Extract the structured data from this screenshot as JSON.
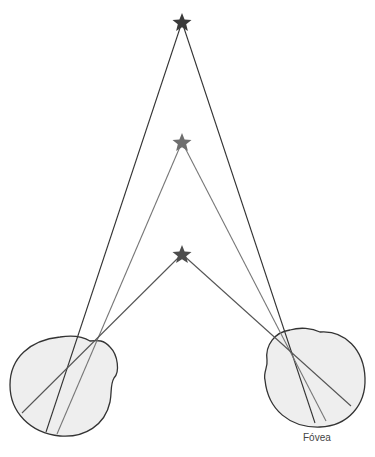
{
  "diagram": {
    "labels": {
      "fovea": "Fóvea"
    },
    "colors": {
      "background": "#ffffff",
      "eye_fill": "#eeeeee",
      "eye_stroke": "#333333",
      "far_star": "#3a3a3a",
      "mid_star": "#6e6e6e",
      "near_star": "#4d4d4d",
      "far_line": "#333333",
      "mid_line": "#777777",
      "near_line": "#555555"
    },
    "stars": [
      {
        "name": "far",
        "x": 182,
        "y": 22
      },
      {
        "name": "middle",
        "x": 182,
        "y": 142
      },
      {
        "name": "near",
        "x": 182,
        "y": 254
      }
    ],
    "eyes": [
      {
        "name": "left",
        "nodal": {
          "x": 78,
          "y": 364
        },
        "retina_points": [
          {
            "x": 22,
            "y": 413
          },
          {
            "x": 46,
            "y": 432
          },
          {
            "x": 57,
            "y": 434
          }
        ]
      },
      {
        "name": "right",
        "nodal": {
          "x": 292,
          "y": 358
        },
        "retina_points": [
          {
            "x": 315,
            "y": 423
          },
          {
            "x": 326,
            "y": 421
          },
          {
            "x": 351,
            "y": 406
          }
        ]
      }
    ]
  }
}
